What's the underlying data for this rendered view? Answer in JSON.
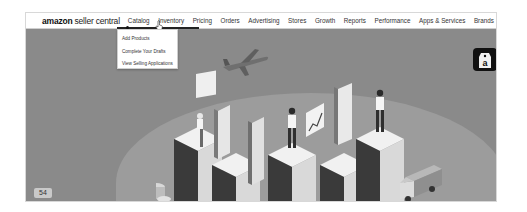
{
  "nav": {
    "logo": {
      "brand": "amazon",
      "product": "seller central"
    },
    "items": [
      {
        "label": "Catalog"
      },
      {
        "label": "Inventory"
      },
      {
        "label": "Pricing"
      },
      {
        "label": "Orders"
      },
      {
        "label": "Advertising"
      },
      {
        "label": "Stores"
      },
      {
        "label": "Growth"
      },
      {
        "label": "Reports"
      },
      {
        "label": "Performance"
      },
      {
        "label": "Apps & Services"
      },
      {
        "label": "Brands"
      }
    ],
    "active_item": "Catalog"
  },
  "dropdown": {
    "items": [
      {
        "label": "Add Products"
      },
      {
        "label": "Complete Your Drafts"
      },
      {
        "label": "View Selling Applications"
      }
    ]
  },
  "hero": {
    "badge": "54",
    "icons": [
      "airplane-icon",
      "amazon-tag-icon",
      "delivery-truck-icon"
    ],
    "colors": {
      "background": "#8a8a8a",
      "blob": "#9c9c9c"
    }
  }
}
